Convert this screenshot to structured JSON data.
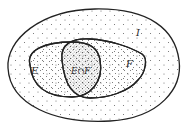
{
  "diagram": {
    "type": "venn",
    "universe": {
      "label": "I"
    },
    "sets": [
      {
        "label": "E"
      },
      {
        "label": "F"
      }
    ],
    "intersection": {
      "label": "E∩F"
    }
  },
  "colors": {
    "stroke": "#222222",
    "dots": "#555555",
    "background": "#ffffff"
  }
}
